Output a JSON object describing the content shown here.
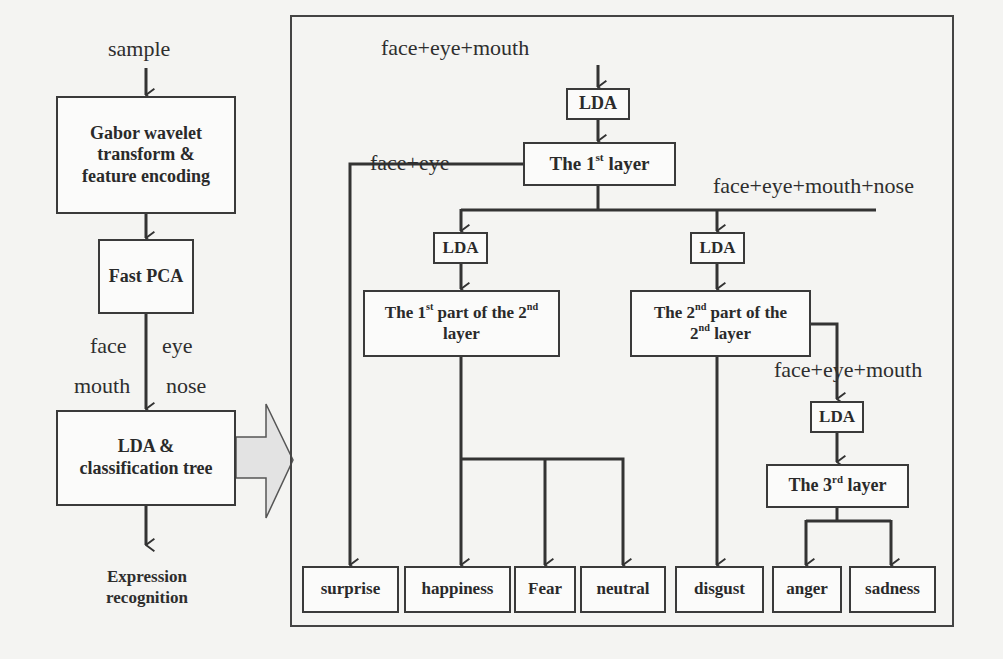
{
  "pipeline": {
    "input_label": "sample",
    "steps": [
      {
        "id": "gabor",
        "label": "Gabor wavelet transform & feature encoding",
        "lines": [
          "Gabor wavelet",
          "transform &",
          "feature encoding"
        ]
      },
      {
        "id": "fast_pca",
        "label": "Fast PCA"
      },
      {
        "id": "lda_tree",
        "label": "LDA & classification tree",
        "lines": [
          "LDA &",
          "classification tree"
        ]
      }
    ],
    "region_labels": {
      "left_top": "face",
      "right_top": "eye",
      "left_bottom": "mouth",
      "right_bottom": "nose"
    },
    "output_label": "Expression recognition",
    "output_lines": [
      "Expression",
      "recognition"
    ]
  },
  "tree": {
    "root_features": "face+eye+mouth",
    "lda_label": "LDA",
    "layer1": {
      "pre": "The 1",
      "sup": "st",
      "post": " layer"
    },
    "branch_left_features": "face+eye",
    "branch_right_features": "face+eye+mouth+nose",
    "layer2_part1": {
      "l1_pre": "The 1",
      "l1_sup": "st",
      "l1_mid": " part of the 2",
      "l1_sup2": "nd",
      "l2": "layer"
    },
    "layer2_part2": {
      "l1_pre": "The 2",
      "l1_sup": "nd",
      "l1_post": " part of the",
      "l2_pre": "2",
      "l2_sup": "nd",
      "l2_post": " layer"
    },
    "layer3_features": "face+eye+mouth",
    "layer3": {
      "pre": "The 3",
      "sup": "rd",
      "post": " layer"
    },
    "outputs": [
      "surprise",
      "happiness",
      "Fear",
      "neutral",
      "disgust",
      "anger",
      "sadness"
    ]
  },
  "colors": {
    "line": "#333333",
    "box_border": "#3a3a3a",
    "arrow_fill": "#e3e3e3",
    "background": "#f4f4f2"
  }
}
